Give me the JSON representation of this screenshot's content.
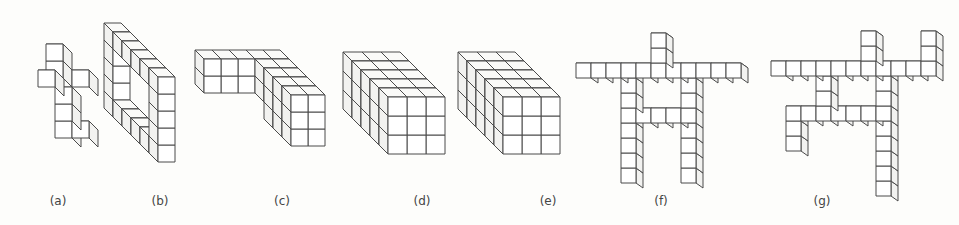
{
  "figure": {
    "background": "#fdfdfb",
    "line_color": "#4a4a4a",
    "face_colors": {
      "front": "#ffffff",
      "top": "#fafaf8",
      "side": "#f2f2f0"
    },
    "panels": [
      {
        "id": "a",
        "label": "(a)",
        "label_x": 58,
        "origin": [
          38,
          138
        ],
        "size": 17,
        "depth": [
          9,
          9
        ],
        "cubes": [
          [
            1,
            0,
            0
          ],
          [
            2,
            0,
            0
          ],
          [
            1,
            1,
            0
          ],
          [
            1,
            2,
            0
          ],
          [
            1,
            3,
            -1
          ],
          [
            0,
            3,
            0
          ],
          [
            2,
            3,
            0
          ],
          [
            1,
            4,
            -1
          ]
        ]
      },
      {
        "id": "b",
        "label": "(b)",
        "label_x": 160,
        "origin": [
          158,
          162
        ],
        "size": 17,
        "depth": [
          -9,
          -9
        ],
        "cubes_note": "frame",
        "cubes": [
          [
            0,
            0,
            0
          ],
          [
            0,
            1,
            0
          ],
          [
            0,
            2,
            0
          ],
          [
            0,
            3,
            0
          ],
          [
            0,
            4,
            0
          ],
          [
            0,
            0,
            1
          ],
          [
            0,
            0,
            2
          ],
          [
            0,
            0,
            3
          ],
          [
            0,
            0,
            4
          ],
          [
            0,
            0,
            5
          ],
          [
            0,
            4,
            1
          ],
          [
            0,
            4,
            2
          ],
          [
            0,
            4,
            3
          ],
          [
            0,
            4,
            4
          ],
          [
            0,
            4,
            5
          ],
          [
            0,
            1,
            5
          ],
          [
            0,
            2,
            5
          ],
          [
            0,
            3,
            5
          ]
        ]
      },
      {
        "id": "c",
        "label": "(c)",
        "label_x": 282,
        "origin": [
          291,
          146
        ],
        "size": 17,
        "depth": [
          -9,
          -9
        ],
        "cubes": [
          [
            0,
            0,
            0
          ],
          [
            1,
            0,
            0
          ],
          [
            0,
            1,
            0
          ],
          [
            1,
            1,
            0
          ],
          [
            0,
            2,
            0
          ],
          [
            1,
            2,
            0
          ],
          [
            0,
            0,
            1
          ],
          [
            0,
            1,
            1
          ],
          [
            0,
            2,
            1
          ],
          [
            0,
            0,
            2
          ],
          [
            0,
            1,
            2
          ],
          [
            0,
            2,
            2
          ],
          [
            0,
            1,
            3
          ],
          [
            0,
            2,
            3
          ],
          [
            0,
            1,
            4
          ],
          [
            0,
            2,
            4
          ],
          [
            -1,
            1,
            4
          ],
          [
            -2,
            1,
            4
          ],
          [
            -3,
            1,
            4
          ],
          [
            -1,
            2,
            4
          ],
          [
            -2,
            2,
            4
          ],
          [
            -3,
            2,
            4
          ],
          [
            1,
            1,
            1
          ],
          [
            1,
            2,
            1
          ],
          [
            1,
            1,
            2
          ],
          [
            1,
            2,
            2
          ],
          [
            1,
            1,
            3
          ],
          [
            1,
            2,
            3
          ],
          [
            1,
            1,
            4
          ],
          [
            1,
            2,
            4
          ]
        ]
      },
      {
        "id": "d",
        "label": "(d)",
        "label_x": 422,
        "origin": [
          388,
          154
        ],
        "size": 19,
        "depth": [
          -9,
          -9
        ],
        "box": [
          3,
          3,
          5
        ]
      },
      {
        "id": "e",
        "label": "(e)",
        "label_x": 548,
        "origin": [
          503,
          154
        ],
        "size": 19,
        "depth": [
          -9,
          -9
        ],
        "box": [
          3,
          3,
          5
        ]
      },
      {
        "id": "f",
        "label": "(f)",
        "label_x": 661,
        "origin": [
          621,
          183
        ],
        "size": 15,
        "depth": [
          7,
          5
        ],
        "cubes": [
          [
            0,
            0,
            0
          ],
          [
            0,
            1,
            0
          ],
          [
            0,
            2,
            0
          ],
          [
            0,
            3,
            0
          ],
          [
            0,
            4,
            0
          ],
          [
            0,
            5,
            0
          ],
          [
            0,
            6,
            0
          ],
          [
            4,
            0,
            0
          ],
          [
            4,
            1,
            0
          ],
          [
            4,
            2,
            0
          ],
          [
            4,
            3,
            0
          ],
          [
            4,
            4,
            0
          ],
          [
            4,
            5,
            0
          ],
          [
            4,
            6,
            0
          ],
          [
            1,
            4,
            0
          ],
          [
            2,
            4,
            0
          ],
          [
            3,
            4,
            0
          ],
          [
            -3,
            7,
            0
          ],
          [
            -2,
            7,
            0
          ],
          [
            -1,
            7,
            0
          ],
          [
            0,
            7,
            0
          ],
          [
            1,
            7,
            0
          ],
          [
            2,
            7,
            0
          ],
          [
            3,
            7,
            0
          ],
          [
            4,
            7,
            0
          ],
          [
            5,
            7,
            0
          ],
          [
            6,
            7,
            0
          ],
          [
            7,
            7,
            0
          ],
          [
            2,
            8,
            0
          ],
          [
            2,
            9,
            0
          ]
        ]
      },
      {
        "id": "g",
        "label": "(g)",
        "label_x": 822,
        "origin": [
          786,
          151
        ],
        "size": 15,
        "depth": [
          7,
          5
        ],
        "cubes": [
          [
            0,
            0,
            0
          ],
          [
            0,
            1,
            0
          ],
          [
            0,
            2,
            0
          ],
          [
            6,
            -3,
            0
          ],
          [
            6,
            -2,
            0
          ],
          [
            6,
            -1,
            0
          ],
          [
            6,
            0,
            0
          ],
          [
            6,
            1,
            0
          ],
          [
            6,
            2,
            0
          ],
          [
            6,
            3,
            0
          ],
          [
            6,
            4,
            0
          ],
          [
            1,
            2,
            0
          ],
          [
            2,
            2,
            0
          ],
          [
            3,
            2,
            0
          ],
          [
            4,
            2,
            0
          ],
          [
            5,
            2,
            0
          ],
          [
            2,
            3,
            0
          ],
          [
            2,
            4,
            0
          ],
          [
            -1,
            5,
            0
          ],
          [
            0,
            5,
            0
          ],
          [
            1,
            5,
            0
          ],
          [
            2,
            5,
            0
          ],
          [
            3,
            5,
            0
          ],
          [
            4,
            5,
            0
          ],
          [
            5,
            5,
            0
          ],
          [
            6,
            5,
            0
          ],
          [
            7,
            5,
            0
          ],
          [
            8,
            5,
            0
          ],
          [
            5,
            6,
            0
          ],
          [
            5,
            7,
            0
          ],
          [
            9,
            5,
            0
          ],
          [
            9,
            6,
            0
          ],
          [
            9,
            7,
            0
          ]
        ]
      }
    ]
  }
}
